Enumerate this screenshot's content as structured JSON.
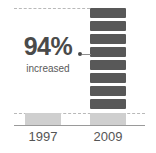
{
  "callout": {
    "value": "94%",
    "label": "increased",
    "dot": "callout-dot",
    "accent_color": "#4a4a4a"
  },
  "axis": {
    "categories": [
      "1997",
      "2009"
    ]
  },
  "colors": {
    "block_fill": "#585858",
    "base_fill": "#cfcfcf",
    "dashed": "#b9b9b9",
    "axis_line": "#9a9a9a",
    "text": "#555555",
    "background": "#ffffff"
  },
  "chart_data": {
    "type": "bar",
    "title": "",
    "subtitle": "",
    "xlabel": "",
    "ylabel": "",
    "categories": [
      "1997",
      "2009"
    ],
    "series": [
      {
        "name": "value",
        "values": [
          1,
          8
        ]
      }
    ],
    "annotations": [
      {
        "text": "94%",
        "sublabel": "increased",
        "points_to": "2009"
      }
    ],
    "legend": [],
    "grid": false,
    "stacked_blocks": {
      "count": 8,
      "category": "2009",
      "block_value": 1
    },
    "base_blocks": {
      "count": 1,
      "categories": [
        "1997",
        "2009"
      ]
    },
    "reference_lines": [
      {
        "position": "top",
        "style": "dashed"
      },
      {
        "position": "baseline",
        "style": "dashed"
      }
    ]
  }
}
